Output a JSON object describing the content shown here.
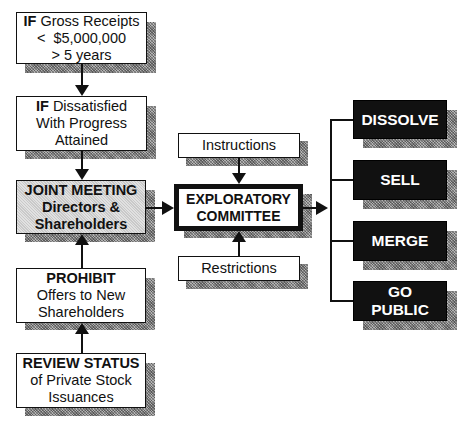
{
  "left_column": {
    "gross_receipts": {
      "keyword": "IF",
      "line1_rest": " Gross Receipts",
      "line2": "<  $5,000,000",
      "line3": "> 5 years"
    },
    "dissatisfied": {
      "keyword": "IF",
      "line1_rest": " Dissatisfied",
      "line2": "With Progress",
      "line3": "Attained"
    },
    "joint_meeting": {
      "line1": "JOINT MEETING",
      "line2": "Directors &",
      "line3": "Shareholders"
    },
    "prohibit": {
      "line1": "PROHIBIT",
      "line2": "Offers to New",
      "line3": "Shareholders"
    },
    "review_status": {
      "line1": "REVIEW STATUS",
      "line2": "of Private Stock",
      "line3": "Issuances"
    }
  },
  "center_column": {
    "instructions": "Instructions",
    "committee": {
      "line1": "EXPLORATORY",
      "line2": "COMMITTEE"
    },
    "restrictions": "Restrictions"
  },
  "outcomes": [
    {
      "line1": "DISSOLVE"
    },
    {
      "line1": "SELL"
    },
    {
      "line1": "MERGE"
    },
    {
      "line1": "GO",
      "line2": "PUBLIC"
    }
  ],
  "colors": {
    "ink": "#111111",
    "background": "#ffffff",
    "shadow": "#8a8a8a",
    "highlight_fill": "#c9c9c9",
    "outcome_fill": "#111111",
    "outcome_text": "#ffffff"
  }
}
